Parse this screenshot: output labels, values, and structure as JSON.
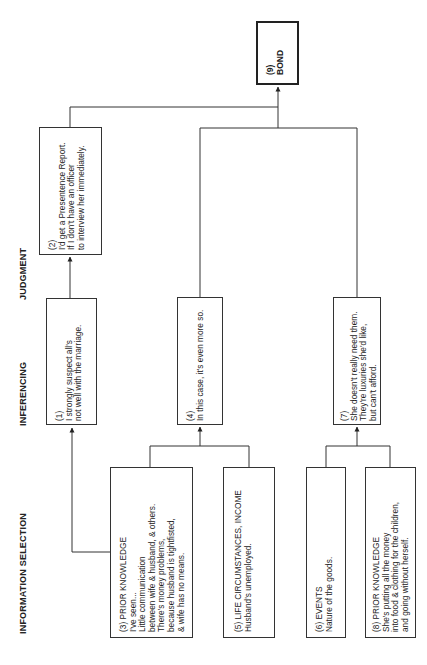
{
  "columns": {
    "judgment": "JUDGMENT",
    "inferencing": "INFERENCING",
    "information_selection": "INFORMATION SELECTION"
  },
  "nodes": {
    "bond": {
      "number": "(9)",
      "lines": [
        "BOND"
      ]
    },
    "n2": {
      "number": "(2)",
      "lines": [
        "I'd get a Presentence Report.",
        "If I don't  have an officer",
        "to interview her immediately."
      ]
    },
    "n1": {
      "number": "(1)",
      "lines": [
        "I strongly suspect all's",
        "not well with the marriage."
      ]
    },
    "n4": {
      "number": "(4)",
      "lines": [
        "In this case, it's even more so."
      ]
    },
    "n7": {
      "number": "(7)",
      "lines": [
        "She doesn't really need them.",
        "They're luxuries she'd like,",
        "but can't afford."
      ]
    },
    "n3": {
      "number": "(3) PRIOR KNOWLEDGE",
      "lines": [
        "I've seen...",
        "Little communication",
        "between wife & husband, & others.",
        "There's money problems,",
        "because husband is tightfisted,",
        "& wife has no means."
      ]
    },
    "n5": {
      "number": "(5) LIFE CIRCUMSTANCES, INCOME",
      "lines": [
        "Husband's unemployed."
      ]
    },
    "n6": {
      "number": "(6) EVENTS",
      "lines": [
        "Nature of the goods."
      ]
    },
    "n8": {
      "number": "(8) PRIOR KNOWLEDGE",
      "lines": [
        "She's putting all the money",
        "into food & clothing for the children,",
        "and going without herself."
      ]
    }
  },
  "edges": [
    [
      "n3",
      "n1"
    ],
    [
      "n1",
      "n2"
    ],
    [
      "n2",
      "bond"
    ],
    [
      "n3",
      "n4"
    ],
    [
      "n5",
      "n4"
    ],
    [
      "n4",
      "bond"
    ],
    [
      "n6",
      "n7"
    ],
    [
      "n8",
      "n7"
    ],
    [
      "n7",
      "bond"
    ]
  ]
}
